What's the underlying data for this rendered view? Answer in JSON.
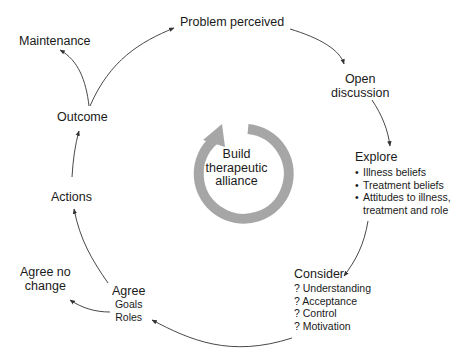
{
  "diagram": {
    "center": {
      "label_lines": [
        "Build",
        "therapeutic",
        "alliance"
      ],
      "ring_color": "#a6a6a6"
    },
    "nodes": {
      "problem": {
        "label": "Problem perceived"
      },
      "open": {
        "label_lines": [
          "Open",
          "discussion"
        ]
      },
      "explore": {
        "title": "Explore",
        "items": [
          "Illness beliefs",
          "Treatment beliefs",
          "Attitudes to illness,",
          "treatment and role"
        ]
      },
      "consider": {
        "title": "Consider",
        "items": [
          "? Understanding",
          "? Acceptance",
          "? Control",
          "? Motivation"
        ]
      },
      "agree": {
        "title": "Agree",
        "items": [
          "Goals",
          "Roles"
        ]
      },
      "agree_no_change": {
        "label_lines": [
          "Agree no",
          "change"
        ]
      },
      "actions": {
        "label": "Actions"
      },
      "outcome": {
        "label": "Outcome"
      },
      "maintenance": {
        "label": "Maintenance"
      }
    },
    "arrow_color": "#333333"
  }
}
